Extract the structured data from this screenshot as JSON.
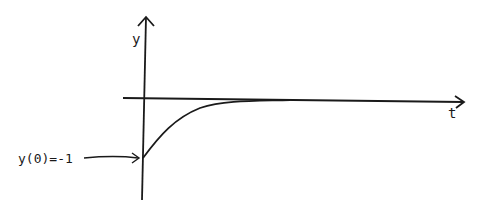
{
  "diagram": {
    "type": "sketch-graph",
    "x_axis_label": "t",
    "y_axis_label": "y",
    "initial_condition_label": "y(0)=-1",
    "curve_description": "starts at y=-1 at t=0 and increases, asymptotically approaching the t-axis (y=0)",
    "stroke_color": "#1a1a1a",
    "background_color": "#ffffff"
  }
}
